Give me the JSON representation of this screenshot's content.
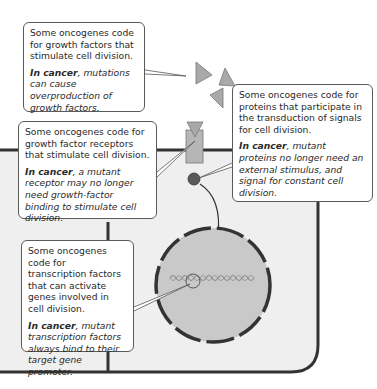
{
  "diagram": {
    "colors": {
      "cell_fill": "#efefef",
      "cell_border": "#333333",
      "nucleus_fill": "#c9c9c9",
      "growth_factor": "#a9a9a9",
      "receptor": "#b6b6b6",
      "signal_protein": "#5a5a5a",
      "dna": "#888888"
    },
    "callouts": [
      {
        "id": "growth-factors",
        "text": "Some oncogenes code for growth factors that stimulate cell division.",
        "cancer_label": "In cancer",
        "cancer_text": ", mutations can cause overproduction of growth factors."
      },
      {
        "id": "growth-factor-receptors",
        "text": "Some oncogenes code for growth factor receptors that stimulate cell division.",
        "cancer_label": "In cancer",
        "cancer_text": ", a mutant receptor may no longer need growth-factor binding to stimulate cell division."
      },
      {
        "id": "signal-transduction",
        "text": "Some oncogenes code for proteins that participate in the transduction of signals for cell division.",
        "cancer_label": "In cancer",
        "cancer_text": ", mutant proteins no longer need an external stimulus, and signal for constant cell division."
      },
      {
        "id": "transcription-factors",
        "text": "Some oncogenes code for transcription factors that can activate genes involved in cell division.",
        "cancer_label": "In cancer",
        "cancer_text": ", mutant transcription factors always bind to their target gene promoter."
      }
    ]
  }
}
